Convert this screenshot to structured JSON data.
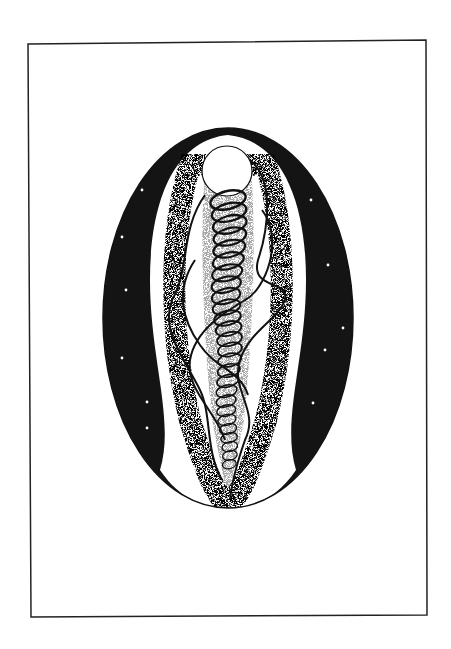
{
  "artwork": {
    "description": "Ink drawing: a framed oval containing a starry night band, a stippled central column with a white orb at the top and a vertical coil of loops with flowing ribbons",
    "colors": {
      "paper": "#ffffff",
      "ink": "#111111",
      "stars": "#ffffff"
    },
    "stars": [
      [
        142,
        190
      ],
      [
        122,
        237
      ],
      [
        126,
        290
      ],
      [
        122,
        358
      ],
      [
        147,
        402
      ],
      [
        147,
        428
      ],
      [
        311,
        200
      ],
      [
        328,
        265
      ],
      [
        343,
        328
      ],
      [
        325,
        350
      ],
      [
        313,
        403
      ]
    ]
  }
}
